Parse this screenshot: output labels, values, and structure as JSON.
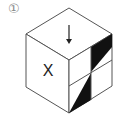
{
  "figure": {
    "number_label": "①",
    "left_face_symbol": "X",
    "top_face_symbol": "down-arrow",
    "right_face": {
      "grid": "2x2",
      "shaded_regions": [
        "top-right quadrant: upper triangle black",
        "bottom-left quadrant: right triangle black"
      ]
    },
    "colors": {
      "line": "#555555",
      "fill_black": "#111111",
      "background": "#ffffff"
    }
  }
}
